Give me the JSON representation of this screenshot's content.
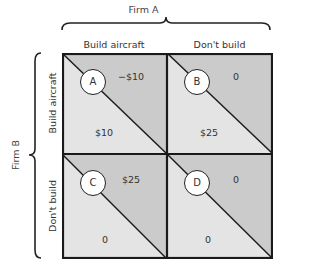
{
  "diagram": {
    "type": "payoff-matrix",
    "colors": {
      "upper_triangle": "#cbcbcb",
      "lower_triangle": "#e4e4e4",
      "border": "#1a1a1a",
      "circle_fill": "#ffffff"
    },
    "column_player": {
      "label": "Firm A",
      "strategies": [
        "Build aircraft",
        "Don't build"
      ]
    },
    "row_player": {
      "label": "Firm B",
      "strategies": [
        "Build aircraft",
        "Don't build"
      ]
    },
    "cells": [
      {
        "id": "A",
        "row": 0,
        "col": 0,
        "upper_payoff": "−$10",
        "lower_payoff": "$10"
      },
      {
        "id": "B",
        "row": 0,
        "col": 1,
        "upper_payoff": "0",
        "lower_payoff": "$25"
      },
      {
        "id": "C",
        "row": 1,
        "col": 0,
        "upper_payoff": "$25",
        "lower_payoff": "0"
      },
      {
        "id": "D",
        "row": 1,
        "col": 1,
        "upper_payoff": "0",
        "lower_payoff": "0"
      }
    ]
  }
}
